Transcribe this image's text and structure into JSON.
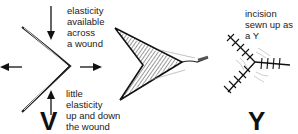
{
  "panels": [
    {
      "id": "v-wound",
      "letter": "V",
      "label_top": "elasticity\navailable\nacross\na wound",
      "label_bottom": "little\nelasticity\nup and down\nthe wound"
    },
    {
      "id": "v-flap",
      "letter": "",
      "description": "V-shaped wound with shaded flap and suture"
    },
    {
      "id": "y-suture",
      "letter": "Y",
      "label_top": "incision\nsewn up as\na Y"
    }
  ]
}
